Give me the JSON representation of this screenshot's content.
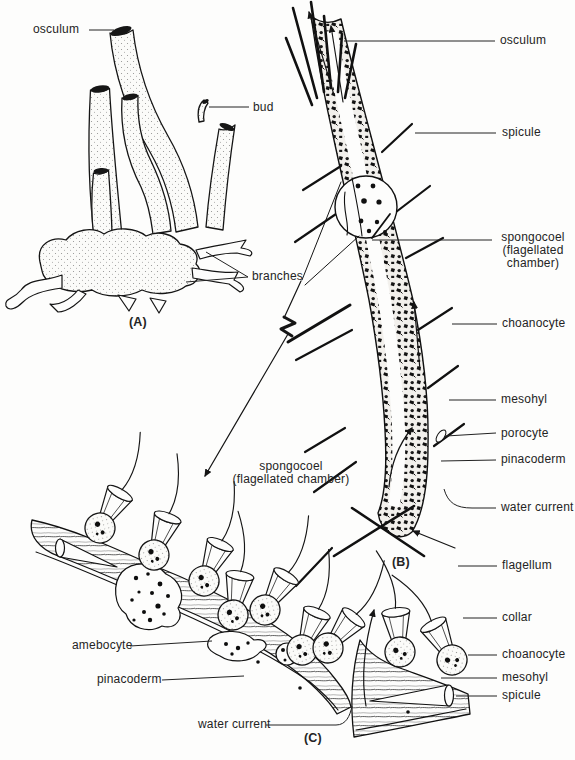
{
  "figure": {
    "colors": {
      "ink": "#1c1c1c",
      "paper": "#fdfdfc"
    },
    "panel_a": {
      "tag": "(A)",
      "osculum": "osculum",
      "bud": "bud",
      "branches": "branches"
    },
    "panel_b": {
      "tag": "(B)",
      "osculum": "osculum",
      "spicule": "spicule",
      "spongocoel": [
        "spongocoel",
        "(flagellated",
        "chamber)"
      ],
      "choanocyte": "choanocyte",
      "mesohyl": "mesohyl",
      "porocyte": "porocyte",
      "pinacoderm": "pinacoderm",
      "water_current": "water current"
    },
    "panel_c": {
      "tag": "(C)",
      "spongocoel_line1": "spongocoel",
      "spongocoel_line2": "(flagellated chamber)",
      "amebocyte": "amebocyte",
      "pinacoderm": "pinacoderm",
      "water_current": "water current",
      "flagellum": "flagellum",
      "collar": "collar",
      "choanocyte": "choanocyte",
      "mesohyl": "mesohyl",
      "spicule": "spicule"
    }
  }
}
